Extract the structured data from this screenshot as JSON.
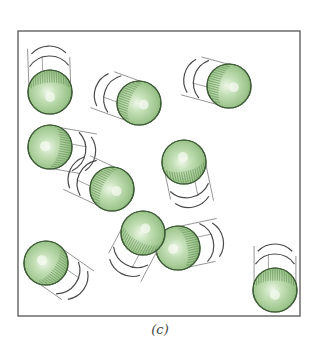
{
  "figure": {
    "caption": "(c)",
    "box": {
      "x": 18,
      "y": 31,
      "width": 282,
      "height": 285,
      "stroke": "#555555"
    },
    "colors": {
      "highlight": "#e4f2dc",
      "mid": "#a9cd99",
      "shade": "#77a468",
      "outline": "#3e5c37",
      "hatch": "#5d8a50",
      "trail": "#8a8a8a",
      "arc": "#4a4a4a"
    },
    "sphere_radius": 22,
    "spheres": [
      {
        "id": 1,
        "cx": 50,
        "cy": 92,
        "trail_angle": -92
      },
      {
        "id": 2,
        "cx": 139,
        "cy": 103,
        "trail_angle": 200
      },
      {
        "id": 3,
        "cx": 229,
        "cy": 86,
        "trail_angle": 195
      },
      {
        "id": 4,
        "cx": 50,
        "cy": 147,
        "trail_angle": 10
      },
      {
        "id": 5,
        "cx": 112,
        "cy": 189,
        "trail_angle": 205
      },
      {
        "id": 6,
        "cx": 184,
        "cy": 162,
        "trail_angle": 78
      },
      {
        "id": 8,
        "cx": 178,
        "cy": 248,
        "trail_angle": -12
      },
      {
        "id": 7,
        "cx": 143,
        "cy": 233,
        "trail_angle": 118
      },
      {
        "id": 9,
        "cx": 46,
        "cy": 263,
        "trail_angle": 35
      },
      {
        "id": 10,
        "cx": 275,
        "cy": 290,
        "trail_angle": -90
      }
    ]
  }
}
